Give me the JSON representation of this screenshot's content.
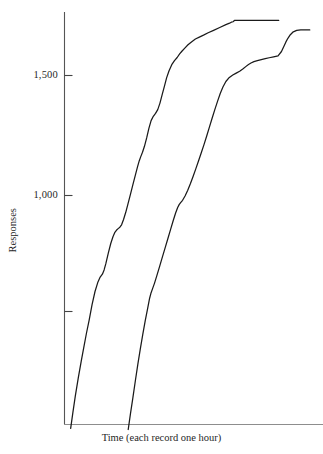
{
  "chart_data": {
    "type": "line",
    "title": "",
    "subtitle": "",
    "xlabel": "Time (each record one hour)",
    "ylabel": "Responses",
    "grid": false,
    "legend": "none",
    "xlim": [
      0,
      100
    ],
    "ylim": [
      0,
      1800
    ],
    "yticks": [
      500,
      1000,
      1500
    ],
    "ytick_labels": [
      "",
      "1,000",
      "1,500"
    ],
    "xticks": [],
    "xtick_labels": [],
    "annotations": [],
    "series": [
      {
        "name": "record-1",
        "color": "#1a1a1a",
        "final_value": 1730,
        "x": [
          2.3,
          3.2,
          4.2,
          5.4,
          6.6,
          7.6,
          8.7,
          9.8,
          11.0,
          12.2,
          13.4,
          14.3,
          15.2,
          15.9,
          16.6,
          17.6,
          18.6,
          19.5,
          20.2,
          20.9,
          21.6,
          22.3,
          23.0,
          23.8,
          24.7,
          25.6,
          26.6,
          27.6,
          28.6,
          29.5,
          30.2,
          30.8,
          31.5,
          32.3,
          33.2,
          34.1,
          35.0,
          35.9,
          36.8,
          37.7,
          38.6,
          39.5,
          40.4,
          41.3,
          42.3,
          43.4,
          44.5,
          45.6,
          46.6,
          47.6,
          48.8,
          50.0,
          51.4,
          53.0,
          54.6,
          56.3,
          58.2,
          60.4,
          62.9,
          65.4,
          66.9,
          67.6,
          68.3,
          69.0,
          70.0,
          72.0,
          75.0,
          78.0,
          81.0,
          84.0,
          86.9
        ],
        "y": [
          30,
          95,
          165,
          240,
          310,
          365,
          425,
          480,
          545,
          600,
          640,
          660,
          672,
          690,
          716,
          760,
          800,
          828,
          845,
          855,
          862,
          868,
          878,
          900,
          930,
          965,
          1005,
          1045,
          1085,
          1120,
          1145,
          1162,
          1180,
          1205,
          1240,
          1280,
          1312,
          1330,
          1342,
          1358,
          1385,
          1420,
          1455,
          1490,
          1520,
          1545,
          1562,
          1575,
          1590,
          1602,
          1615,
          1628,
          1640,
          1652,
          1660,
          1668,
          1678,
          1688,
          1700,
          1712,
          1718,
          1722,
          1724,
          1730,
          1730,
          1730,
          1730,
          1730,
          1730,
          1730,
          1730
        ]
      },
      {
        "name": "record-2",
        "color": "#1a1a1a",
        "final_value": 1690,
        "x": [
          25.7,
          26.6,
          27.6,
          28.6,
          29.6,
          30.6,
          31.6,
          32.6,
          33.6,
          34.4,
          35.0,
          35.6,
          36.4,
          37.4,
          38.5,
          39.6,
          40.7,
          41.8,
          42.9,
          44.0,
          45.0,
          45.8,
          46.4,
          47.0,
          47.8,
          48.8,
          49.9,
          51.0,
          52.1,
          53.2,
          54.3,
          55.4,
          56.5,
          57.6,
          58.7,
          59.8,
          60.9,
          62.0,
          63.1,
          64.2,
          65.4,
          66.8,
          68.2,
          69.6,
          71.0,
          72.4,
          73.6,
          74.6,
          75.6,
          76.8,
          78.2,
          79.8,
          81.4,
          83.0,
          84.8,
          86.6,
          88.0,
          89.0,
          89.8,
          90.6,
          91.6,
          92.8,
          94.2,
          95.8,
          97.5,
          99.5
        ],
        "y": [
          25,
          90,
          158,
          228,
          296,
          360,
          420,
          478,
          530,
          572,
          595,
          612,
          635,
          668,
          706,
          744,
          782,
          820,
          858,
          896,
          928,
          950,
          962,
          970,
          980,
          998,
          1022,
          1050,
          1080,
          1112,
          1145,
          1178,
          1212,
          1248,
          1285,
          1322,
          1358,
          1392,
          1425,
          1452,
          1475,
          1492,
          1502,
          1510,
          1518,
          1528,
          1538,
          1546,
          1552,
          1558,
          1562,
          1566,
          1570,
          1574,
          1578,
          1582,
          1600,
          1622,
          1640,
          1655,
          1670,
          1682,
          1688,
          1690,
          1690,
          1690
        ]
      }
    ]
  },
  "axes": {
    "y_tick_1500": "1,500",
    "y_tick_1000": "1,000",
    "y_tick_500": "",
    "y_axis_title": "Responses",
    "x_axis_title": "Time (each record one hour)"
  },
  "colors": {
    "line": "#1a1a1a",
    "axis": "#4a4a4a",
    "background": "#ffffff",
    "text": "#1f1f1f"
  }
}
